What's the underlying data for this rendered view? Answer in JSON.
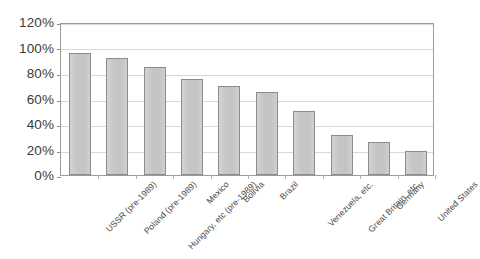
{
  "chart_data": {
    "type": "bar",
    "title": "",
    "subtitle": "",
    "xlabel": "",
    "ylabel": "",
    "ylim": [
      0,
      120
    ],
    "ytick_labels": [
      "120%",
      "100%",
      "80%",
      "60%",
      "40%",
      "20%",
      "0%"
    ],
    "ytick_values": [
      120,
      100,
      80,
      60,
      40,
      20,
      0
    ],
    "grid": true,
    "legend": false,
    "legend_position": "none",
    "value_suffix": "%",
    "categories": [
      "USSR (pre-1989)",
      "Poland (pre-1989)",
      "Hungary, etc (pre-1989)",
      "Mexico",
      "Bolivia",
      "Brazil",
      "Venezuela, etc.",
      "Great Britain, etc.",
      "Germany",
      "United States"
    ],
    "values": [
      96,
      92,
      85,
      75,
      70,
      65,
      50,
      31,
      26,
      19
    ],
    "bar_color": "#c9c9c9",
    "bar_border_color": "#8c8c8c",
    "gridline_color": "#d9d9d9",
    "axis_color": "#9a9a9a",
    "plot_background": "#ffffff",
    "text_color": "#3b3b3b"
  }
}
